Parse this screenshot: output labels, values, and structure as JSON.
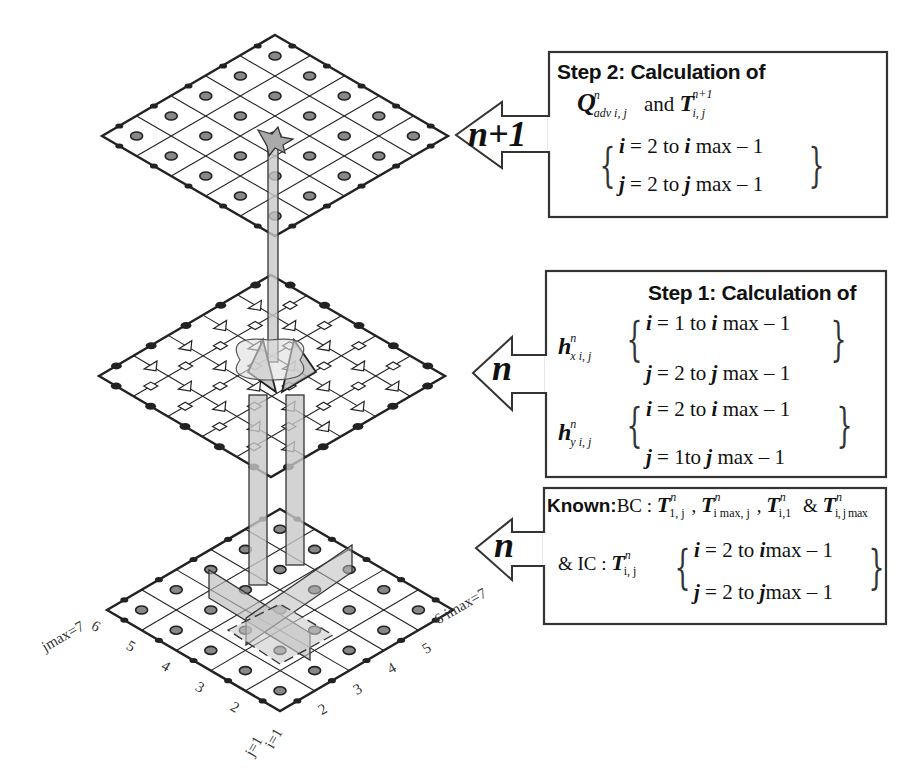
{
  "figure": {
    "levels": [
      {
        "name": "time-level-n+1",
        "arrow_label": "n+1",
        "grid_cells": 5,
        "node_marker": "dot",
        "description": "top grid (temperature T at n+1)"
      },
      {
        "name": "time-level-n-flux",
        "arrow_label": "n",
        "grid_cells": 5,
        "node_marker": "square-and-triangle",
        "description": "middle grid (heat fluxes h)"
      },
      {
        "name": "time-level-n",
        "arrow_label": "n",
        "grid_cells": 5,
        "node_marker": "dot",
        "description": "bottom grid (known T at n)"
      }
    ],
    "colors": {
      "line": "#222222",
      "fill_gray": "#c8c8c8",
      "node_fill": "#888888",
      "background": "#ffffff"
    }
  },
  "step2": {
    "heading": "Step 2: Calculation of",
    "q_symbol": "Q",
    "q_sup": "n",
    "q_sub": "adv i, j",
    "and": "and",
    "t_symbol": "T",
    "t_sup": "n+1",
    "t_sub": "i, j",
    "range_i": {
      "var": "i",
      "eq": " = 2  to ",
      "var2": "i",
      "tail": " max – 1"
    },
    "range_j": {
      "var": "j",
      "eq": " = 2 to ",
      "var2": "j",
      "tail": " max – 1"
    }
  },
  "step1": {
    "heading": "Step 1: Calculation of",
    "hx": {
      "symbol": "h",
      "sup": "n",
      "sub": "x i, j",
      "range_i": {
        "var": "i",
        "eq": " = 1 to ",
        "var2": "i",
        "tail": " max – 1"
      },
      "range_j": {
        "var": "j",
        "eq": " = 2 to  ",
        "var2": "j",
        "tail": " max – 1"
      }
    },
    "hy": {
      "symbol": "h",
      "sup": "n",
      "sub": "y i, j",
      "range_i": {
        "var": "i",
        "eq": " = 2  to ",
        "var2": "i",
        "tail": " max – 1"
      },
      "range_j": {
        "var": "j",
        "eq": " = 1to  ",
        "var2": "j",
        "tail": " max – 1"
      }
    }
  },
  "known": {
    "heading": "Known:",
    "bc_label": "BC : ",
    "bc_terms": [
      {
        "symbol": "T",
        "sup": "n",
        "sub": "1, j"
      },
      {
        "symbol": "T",
        "sup": "n",
        "sub": "i max, j"
      },
      {
        "symbol": "T",
        "sup": "n",
        "sub": "i,1"
      },
      {
        "symbol": "T",
        "sup": "n",
        "sub": "i, j max"
      }
    ],
    "bc_separators": [
      ", ",
      ", ",
      " & "
    ],
    "ic_label": "& IC : ",
    "ic_term": {
      "symbol": "T",
      "sup": "n",
      "sub": "i, j"
    },
    "range_i": {
      "var": "i",
      "eq": " = 2 to ",
      "var2": "i",
      "tail": "max – 1"
    },
    "range_j": {
      "var": "j",
      "eq": " = 2 to ",
      "var2": "j",
      "tail": "max – 1"
    }
  },
  "axes": {
    "j_labels": [
      "j=1",
      "2",
      "3",
      "4",
      "5",
      "6",
      "jmax=7"
    ],
    "i_labels": [
      "i=1",
      "2",
      "3",
      "4",
      "5",
      "6 imax=7"
    ]
  }
}
